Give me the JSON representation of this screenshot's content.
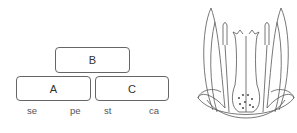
{
  "abc_model": {
    "boxes": [
      {
        "id": "B",
        "label": "B"
      },
      {
        "id": "A",
        "label": "A"
      },
      {
        "id": "C",
        "label": "C"
      }
    ],
    "whorls": [
      {
        "abbr": "se"
      },
      {
        "abbr": "pe"
      },
      {
        "abbr": "st"
      },
      {
        "abbr": "ca"
      }
    ]
  },
  "flower_illustration": {
    "description": "longitudinal section of flower with sepals, petals, stamens, carpel"
  }
}
